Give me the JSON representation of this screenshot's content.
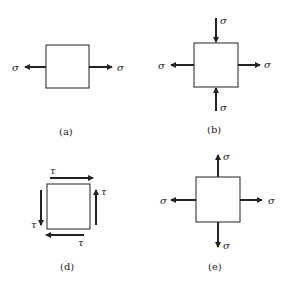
{
  "figure": {
    "panels": [
      {
        "id": "a",
        "caption": "(a)",
        "description": "uniaxial tension",
        "labels": {
          "left": "σ",
          "right": "σ"
        }
      },
      {
        "id": "b",
        "caption": "(b)",
        "description": "tension horizontal, compression vertical",
        "labels": {
          "left": "σ",
          "right": "σ",
          "top": "σ",
          "bottom": "σ"
        }
      },
      {
        "id": "d",
        "caption": "(d)",
        "description": "pure shear",
        "labels": {
          "top": "τ",
          "right": "τ",
          "bottom": "τ",
          "left": "τ"
        }
      },
      {
        "id": "e",
        "caption": "(e)",
        "description": "biaxial tension",
        "labels": {
          "left": "σ",
          "right": "σ",
          "top": "σ",
          "bottom": "σ"
        }
      }
    ],
    "colors": {
      "line": "#222222",
      "background": "#ffffff"
    }
  }
}
